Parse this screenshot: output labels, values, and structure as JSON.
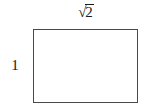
{
  "figure": {
    "name": "labeled-rectangle",
    "background_color": "#ffffff",
    "stroke_color": "#4a4a4a",
    "fill_color": "#ffffff",
    "text_color": "#1a1a1a",
    "width_label": {
      "text": "√2",
      "radical_sign": "√",
      "radicand": "2",
      "position": "top",
      "meaning": "width of rectangle equals square root of 2"
    },
    "height_label": {
      "text": "1",
      "position": "left",
      "meaning": "height of rectangle equals 1"
    }
  }
}
